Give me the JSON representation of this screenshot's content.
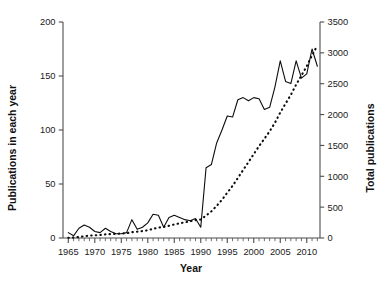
{
  "chart_data": {
    "type": "line",
    "title": "",
    "subtitle": "",
    "xlabel": "Year",
    "ylabel": "Publications in each year",
    "y2label": "Total publications",
    "xlim": [
      1964,
      2012.5
    ],
    "ylim": [
      0,
      200
    ],
    "y2lim": [
      0,
      3500
    ],
    "grid": false,
    "legend": "none",
    "xticks": [
      1965,
      1970,
      1975,
      1980,
      1985,
      1990,
      1995,
      2000,
      2005,
      2010
    ],
    "xtick_labels": [
      "1965",
      "1970",
      "1975",
      "1980",
      "1985",
      "1990",
      "1995",
      "2000",
      "2005",
      "2010"
    ],
    "xminor_step": 1,
    "yticks": [
      0,
      50,
      100,
      150,
      200
    ],
    "ytick_labels": [
      "0",
      "50",
      "100",
      "150",
      "200"
    ],
    "y2ticks": [
      0,
      500,
      1000,
      1500,
      2000,
      2500,
      3000,
      3500
    ],
    "y2tick_labels": [
      "0",
      "500",
      "1000",
      "1500",
      "2000",
      "2500",
      "3000",
      "3500"
    ],
    "x": [
      1965,
      1966,
      1967,
      1968,
      1969,
      1970,
      1971,
      1972,
      1973,
      1974,
      1975,
      1976,
      1977,
      1978,
      1979,
      1980,
      1981,
      1982,
      1983,
      1984,
      1985,
      1986,
      1987,
      1988,
      1989,
      1990,
      1991,
      1992,
      1993,
      1994,
      1995,
      1996,
      1997,
      1998,
      1999,
      2000,
      2001,
      2002,
      2003,
      2004,
      2005,
      2006,
      2007,
      2008,
      2009,
      2010,
      2011,
      2012
    ],
    "series": [
      {
        "name": "Publications in each year",
        "axis": "left",
        "style": "solid",
        "values": [
          5,
          2,
          9,
          12,
          10,
          6,
          5,
          9,
          6,
          4,
          4,
          5,
          17,
          8,
          10,
          14,
          22,
          21,
          10,
          19,
          21,
          19,
          17,
          16,
          18,
          10,
          65,
          68,
          88,
          100,
          113,
          112,
          128,
          130,
          127,
          130,
          129,
          119,
          121,
          140,
          164,
          145,
          143,
          164,
          148,
          152,
          175,
          159
        ]
      },
      {
        "name": "Total publications",
        "axis": "right",
        "style": "dotted",
        "values": [
          5,
          7,
          16,
          28,
          38,
          44,
          49,
          58,
          64,
          68,
          72,
          77,
          94,
          102,
          112,
          126,
          148,
          169,
          179,
          198,
          219,
          238,
          255,
          271,
          289,
          299,
          364,
          432,
          520,
          620,
          733,
          845,
          973,
          1103,
          1230,
          1360,
          1489,
          1608,
          1729,
          1869,
          2033,
          2178,
          2321,
          2485,
          2633,
          2785,
          2960,
          3119
        ]
      }
    ]
  }
}
